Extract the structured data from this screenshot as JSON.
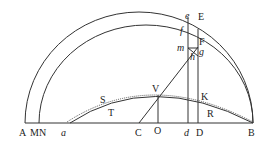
{
  "figure": {
    "labels": {
      "A": "A",
      "M": "M",
      "N": "N",
      "a": "a",
      "C": "C",
      "O": "O",
      "d": "d",
      "D": "D",
      "B": "B",
      "e": "e",
      "E": "E",
      "f": "f",
      "F": "F",
      "m": "m",
      "g": "g",
      "h": "h",
      "V": "V",
      "K": "K",
      "S": "S",
      "T": "T",
      "R": "R"
    }
  }
}
